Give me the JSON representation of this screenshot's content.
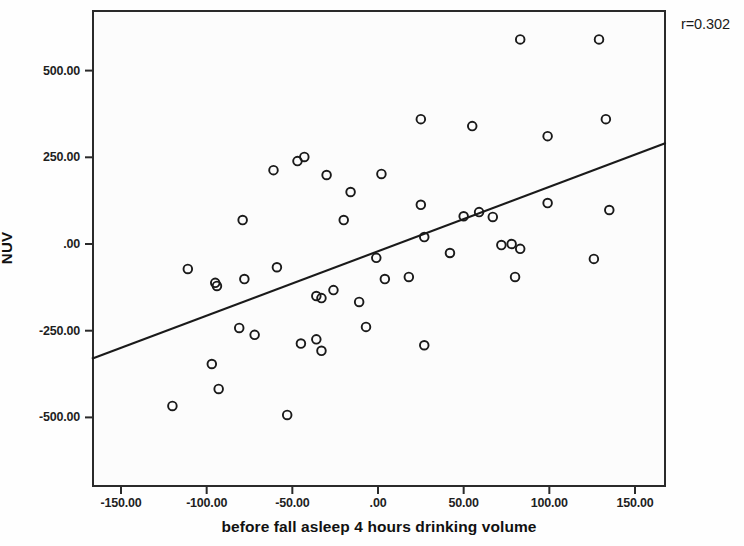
{
  "chart_data": {
    "type": "scatter",
    "title": "",
    "xlabel": "before fall asleep 4 hours drinking volume",
    "ylabel": "NUV",
    "xlim": [
      -175,
      175
    ],
    "ylim": [
      -600,
      640
    ],
    "grid": false,
    "legend": "none",
    "annotations": [
      {
        "text": "r=0.302",
        "position": "top-right-outside"
      }
    ],
    "xticks": [
      -150,
      -100,
      -50,
      0,
      50,
      100,
      150
    ],
    "xtick_labels": [
      "-150.00",
      "-100.00",
      "-50.00",
      ".00",
      "50.00",
      "100.00",
      "150.00"
    ],
    "yticks": [
      500,
      250,
      0,
      -250,
      -500
    ],
    "ytick_labels": [
      "500.00",
      "250.00",
      ".00",
      "-250.00",
      "-500.00"
    ],
    "marker": {
      "shape": "circle",
      "fill": "none",
      "edge_color": "#1a1a1a",
      "size": 7
    },
    "fit_line": {
      "label": "linear fit",
      "color": "#1a1a1a",
      "x": [
        -167,
        168
      ],
      "y": [
        -331,
        291
      ]
    },
    "points": [
      {
        "x": -120,
        "y": -467
      },
      {
        "x": -111,
        "y": -72
      },
      {
        "x": -97,
        "y": -346
      },
      {
        "x": -95,
        "y": -112
      },
      {
        "x": -94,
        "y": -121
      },
      {
        "x": -93,
        "y": -418
      },
      {
        "x": -81,
        "y": -242
      },
      {
        "x": -79,
        "y": 69
      },
      {
        "x": -78,
        "y": -101
      },
      {
        "x": -72,
        "y": -262
      },
      {
        "x": -61,
        "y": 213
      },
      {
        "x": -59,
        "y": -67
      },
      {
        "x": -53,
        "y": -493
      },
      {
        "x": -47,
        "y": 239
      },
      {
        "x": -45,
        "y": -287
      },
      {
        "x": -43,
        "y": 251
      },
      {
        "x": -36,
        "y": -150
      },
      {
        "x": -36,
        "y": -275
      },
      {
        "x": -33,
        "y": -156
      },
      {
        "x": -33,
        "y": -308
      },
      {
        "x": -30,
        "y": 199
      },
      {
        "x": -26,
        "y": -133
      },
      {
        "x": -20,
        "y": 69
      },
      {
        "x": -16,
        "y": 150
      },
      {
        "x": -11,
        "y": -167
      },
      {
        "x": -7,
        "y": -239
      },
      {
        "x": -1,
        "y": -40
      },
      {
        "x": 2,
        "y": 202
      },
      {
        "x": 4,
        "y": -101
      },
      {
        "x": 18,
        "y": -95
      },
      {
        "x": 25,
        "y": 360
      },
      {
        "x": 25,
        "y": 113
      },
      {
        "x": 27,
        "y": 20
      },
      {
        "x": 27,
        "y": -292
      },
      {
        "x": 42,
        "y": -26
      },
      {
        "x": 50,
        "y": 80
      },
      {
        "x": 55,
        "y": 340
      },
      {
        "x": 59,
        "y": 92
      },
      {
        "x": 67,
        "y": 78
      },
      {
        "x": 72,
        "y": -3
      },
      {
        "x": 78,
        "y": 0
      },
      {
        "x": 80,
        "y": -95
      },
      {
        "x": 83,
        "y": 590
      },
      {
        "x": 83,
        "y": -14
      },
      {
        "x": 99,
        "y": 311
      },
      {
        "x": 99,
        "y": 118
      },
      {
        "x": 126,
        "y": -43
      },
      {
        "x": 129,
        "y": 590
      },
      {
        "x": 133,
        "y": 360
      },
      {
        "x": 135,
        "y": 98
      }
    ]
  },
  "axes": {
    "y_title": "NUV",
    "x_title": "before fall asleep 4 hours drinking volume"
  },
  "annotation": {
    "r_value": "r=0.302"
  }
}
